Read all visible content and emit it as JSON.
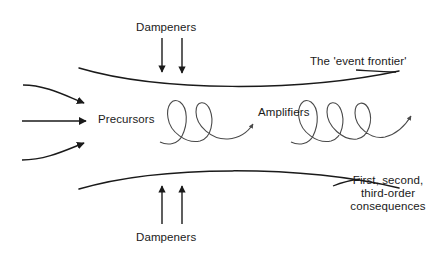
{
  "diagram": {
    "stroke_color": "#1a1a1a",
    "background_color": "#ffffff",
    "labels": {
      "dampeners_top": "Dampeners",
      "dampeners_bottom": "Dampeners",
      "precursors": "Precursors",
      "amplifiers": "Amplifiers",
      "event_frontier": "The 'event frontier'",
      "consequences_line1": "First, second,",
      "consequences_line2": "third-order",
      "consequences_line3": "consequences"
    },
    "elements": {
      "upper_frontier_curve": "arc bowing downward from left to right",
      "lower_frontier_curve": "arc bowing upward from left to right",
      "inflow_arrow_top": "curved arrow entering from upper left",
      "inflow_arrow_middle": "straight horizontal arrow entering from left",
      "inflow_arrow_bottom": "curved arrow entering from lower left",
      "dampener_arrow_top_left": "arrow pointing down onto upper curve",
      "dampener_arrow_top_right": "arrow pointing down onto upper curve",
      "dampener_arrow_bottom_left": "arrow pointing up onto lower curve",
      "dampener_arrow_bottom_right": "arrow pointing up onto lower curve",
      "amplifier_spiral_left": "two-loop coil with arrowhead",
      "amplifier_spiral_right": "three-loop coil with arrowhead",
      "frontier_leader_line": "short line from label to upper curve",
      "consequences_leader_line": "short line from label to lower curve"
    },
    "counts": {
      "inflow_arrows": 3,
      "dampener_arrows_top": 2,
      "dampener_arrows_bottom": 2,
      "left_spiral_loops": 2,
      "right_spiral_loops": 3
    }
  }
}
